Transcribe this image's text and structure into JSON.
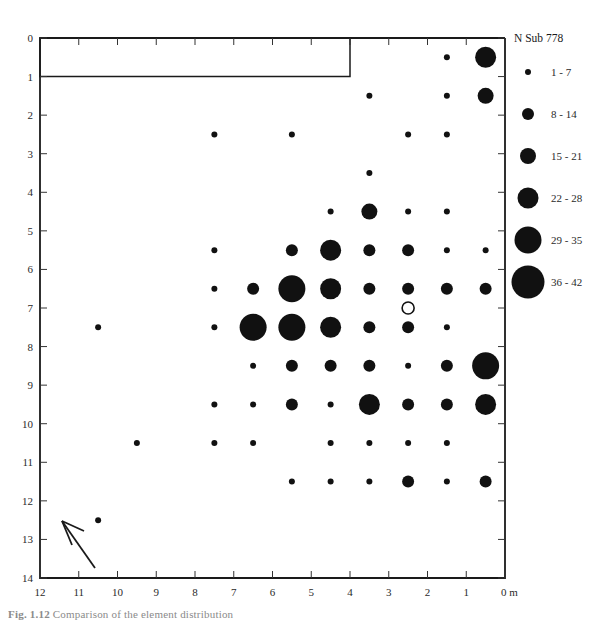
{
  "figure": {
    "caption_prefix": "Fig. 1.12",
    "caption_body": "Comparison of the element distribution",
    "units_label": "0 m"
  },
  "legend": {
    "title": "N Sub  778",
    "entries": [
      {
        "label": "1 - 7",
        "radius": 3.0
      },
      {
        "label": "8 - 14",
        "radius": 6.0
      },
      {
        "label": "15 - 21",
        "radius": 8.0
      },
      {
        "label": "22 - 28",
        "radius": 10.5
      },
      {
        "label": "29 - 35",
        "radius": 13.5
      },
      {
        "label": "36 - 42",
        "radius": 16.5
      }
    ]
  },
  "axes": {
    "x_label_unit": "m",
    "x_ticks": [
      "12",
      "11",
      "10",
      "9",
      "8",
      "7",
      "6",
      "5",
      "4",
      "3",
      "2",
      "1",
      "0 m"
    ],
    "y_ticks": [
      "0",
      "1",
      "2",
      "3",
      "4",
      "5",
      "6",
      "7",
      "8",
      "9",
      "10",
      "11",
      "12",
      "13",
      "14"
    ],
    "x_min": 0,
    "x_max": 12,
    "y_min": 0,
    "y_max": 14,
    "x_reversed": true
  },
  "inset_box": {
    "name": "excluded-area-rectangle",
    "x_from": 12,
    "x_to": 4,
    "y_from": 0,
    "y_to": 1
  },
  "north_arrow": {
    "name": "north-arrow",
    "direction": "northwest"
  },
  "chart_data": {
    "type": "scatter",
    "title": "N Sub  778",
    "xlabel": "0 m",
    "ylabel": "",
    "xlim": [
      12,
      0
    ],
    "ylim": [
      0,
      14
    ],
    "grid": false,
    "legend_position": "right",
    "size_encoding": "count classes: 1-7, 8-14, 15-21, 22-28, 29-35, 36-42",
    "points": [
      {
        "x": 0.5,
        "y": 0.5,
        "count": 22,
        "open": false
      },
      {
        "x": 1.5,
        "y": 0.5,
        "count": 4,
        "open": false
      },
      {
        "x": 0.5,
        "y": 1.5,
        "count": 15,
        "open": false
      },
      {
        "x": 1.5,
        "y": 1.5,
        "count": 3,
        "open": false
      },
      {
        "x": 3.5,
        "y": 1.5,
        "count": 3,
        "open": false
      },
      {
        "x": 1.5,
        "y": 2.5,
        "count": 3,
        "open": false
      },
      {
        "x": 5.5,
        "y": 2.5,
        "count": 4,
        "open": false
      },
      {
        "x": 2.5,
        "y": 2.5,
        "count": 3,
        "open": false
      },
      {
        "x": 7.5,
        "y": 2.5,
        "count": 3,
        "open": false
      },
      {
        "x": 3.5,
        "y": 3.5,
        "count": 3,
        "open": false
      },
      {
        "x": 4.5,
        "y": 4.5,
        "count": 3,
        "open": false
      },
      {
        "x": 3.5,
        "y": 4.5,
        "count": 20,
        "open": false
      },
      {
        "x": 2.5,
        "y": 4.5,
        "count": 4,
        "open": false
      },
      {
        "x": 1.5,
        "y": 4.5,
        "count": 3,
        "open": false
      },
      {
        "x": 7.5,
        "y": 5.5,
        "count": 3,
        "open": false
      },
      {
        "x": 5.5,
        "y": 5.5,
        "count": 10,
        "open": false
      },
      {
        "x": 4.5,
        "y": 5.5,
        "count": 24,
        "open": false
      },
      {
        "x": 3.5,
        "y": 5.5,
        "count": 12,
        "open": false
      },
      {
        "x": 2.5,
        "y": 5.5,
        "count": 13,
        "open": false
      },
      {
        "x": 1.5,
        "y": 5.5,
        "count": 4,
        "open": false
      },
      {
        "x": 0.5,
        "y": 5.5,
        "count": 4,
        "open": false
      },
      {
        "x": 7.5,
        "y": 6.5,
        "count": 4,
        "open": false
      },
      {
        "x": 6.5,
        "y": 6.5,
        "count": 10,
        "open": false
      },
      {
        "x": 5.5,
        "y": 6.5,
        "count": 33,
        "open": false
      },
      {
        "x": 4.5,
        "y": 6.5,
        "count": 28,
        "open": false
      },
      {
        "x": 3.5,
        "y": 6.5,
        "count": 14,
        "open": false
      },
      {
        "x": 2.5,
        "y": 6.5,
        "count": 13,
        "open": false
      },
      {
        "x": 1.5,
        "y": 6.5,
        "count": 13,
        "open": false
      },
      {
        "x": 0.5,
        "y": 6.5,
        "count": 11,
        "open": false
      },
      {
        "x": 10.5,
        "y": 7.5,
        "count": 3,
        "open": false
      },
      {
        "x": 7.5,
        "y": 7.5,
        "count": 3,
        "open": false
      },
      {
        "x": 2.5,
        "y": 7.0,
        "count": 12,
        "open": true
      },
      {
        "x": 6.5,
        "y": 7.5,
        "count": 30,
        "open": false
      },
      {
        "x": 5.5,
        "y": 7.5,
        "count": 30,
        "open": false
      },
      {
        "x": 4.5,
        "y": 7.5,
        "count": 28,
        "open": false
      },
      {
        "x": 3.5,
        "y": 7.5,
        "count": 14,
        "open": false
      },
      {
        "x": 2.5,
        "y": 7.5,
        "count": 13,
        "open": false
      },
      {
        "x": 1.5,
        "y": 7.5,
        "count": 4,
        "open": false
      },
      {
        "x": 6.5,
        "y": 8.5,
        "count": 3,
        "open": false
      },
      {
        "x": 5.5,
        "y": 8.5,
        "count": 11,
        "open": false
      },
      {
        "x": 4.5,
        "y": 8.5,
        "count": 13,
        "open": false
      },
      {
        "x": 3.5,
        "y": 8.5,
        "count": 13,
        "open": false
      },
      {
        "x": 2.5,
        "y": 8.5,
        "count": 4,
        "open": false
      },
      {
        "x": 1.5,
        "y": 8.5,
        "count": 10,
        "open": false
      },
      {
        "x": 0.5,
        "y": 8.5,
        "count": 33,
        "open": false
      },
      {
        "x": 7.5,
        "y": 9.5,
        "count": 3,
        "open": false
      },
      {
        "x": 6.5,
        "y": 9.5,
        "count": 3,
        "open": false
      },
      {
        "x": 5.5,
        "y": 9.5,
        "count": 11,
        "open": false
      },
      {
        "x": 4.5,
        "y": 9.5,
        "count": 3,
        "open": false
      },
      {
        "x": 3.5,
        "y": 9.5,
        "count": 25,
        "open": false
      },
      {
        "x": 2.5,
        "y": 9.5,
        "count": 11,
        "open": false
      },
      {
        "x": 1.5,
        "y": 9.5,
        "count": 10,
        "open": false
      },
      {
        "x": 0.5,
        "y": 9.5,
        "count": 24,
        "open": false
      },
      {
        "x": 9.5,
        "y": 10.5,
        "count": 3,
        "open": false
      },
      {
        "x": 7.5,
        "y": 10.5,
        "count": 3,
        "open": false
      },
      {
        "x": 6.5,
        "y": 10.5,
        "count": 3,
        "open": false
      },
      {
        "x": 4.5,
        "y": 10.5,
        "count": 3,
        "open": false
      },
      {
        "x": 3.5,
        "y": 10.5,
        "count": 3,
        "open": false
      },
      {
        "x": 2.5,
        "y": 10.5,
        "count": 3,
        "open": false
      },
      {
        "x": 1.5,
        "y": 10.5,
        "count": 3,
        "open": false
      },
      {
        "x": 5.5,
        "y": 11.5,
        "count": 3,
        "open": false
      },
      {
        "x": 4.5,
        "y": 11.5,
        "count": 3,
        "open": false
      },
      {
        "x": 3.5,
        "y": 11.5,
        "count": 3,
        "open": false
      },
      {
        "x": 2.5,
        "y": 11.5,
        "count": 10,
        "open": false
      },
      {
        "x": 1.5,
        "y": 11.5,
        "count": 3,
        "open": false
      },
      {
        "x": 0.5,
        "y": 11.5,
        "count": 10,
        "open": false
      },
      {
        "x": 10.5,
        "y": 12.5,
        "count": 3,
        "open": false
      }
    ]
  }
}
